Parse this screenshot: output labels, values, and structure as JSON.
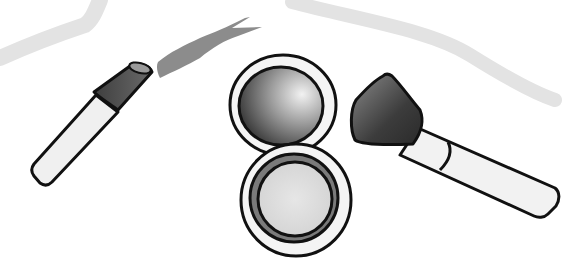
{
  "illustration": {
    "subject": "makeup items",
    "items": [
      {
        "name": "lipstick",
        "color": "#5a5a5a"
      },
      {
        "name": "lipstick-smear",
        "color": "#8c8c8c"
      },
      {
        "name": "compact-mirror",
        "color": "#6e6e6e"
      },
      {
        "name": "blush-brush",
        "color": "#444444"
      }
    ],
    "colors": {
      "background": "#ffffff",
      "outline": "#111111",
      "light-stroke": "#e3e3e3",
      "handle": "#f2f2f2"
    }
  }
}
